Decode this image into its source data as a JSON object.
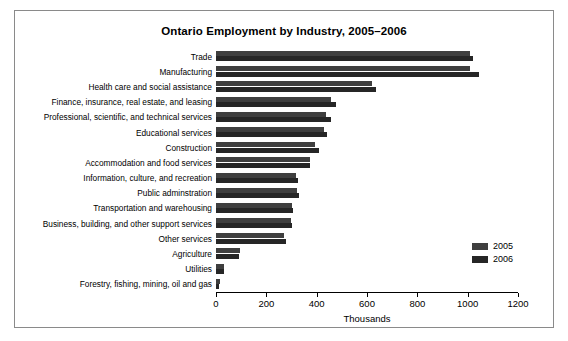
{
  "chart_data": {
    "type": "bar",
    "orientation": "horizontal",
    "title": "Ontario Employment by Industry, 2005–2006",
    "xlabel": "Thousands",
    "ylabel": "",
    "xlim": [
      0,
      1200
    ],
    "xticks": [
      0,
      200,
      400,
      600,
      800,
      1000,
      1200
    ],
    "xtick_labels": [
      "0",
      "200",
      "400",
      "600",
      "800",
      "1000",
      "1200"
    ],
    "grid": false,
    "legend_position": "right-lower",
    "categories": [
      "Trade",
      "Manufacturing",
      "Health care and social assistance",
      "Finance, insurance, real estate, and leasing",
      "Professional, scientific, and technical services",
      "Educational services",
      "Construction",
      "Accommodation and food services",
      "Information, culture, and recreation",
      "Public adminstration",
      "Transportation and warehousing",
      "Business, building, and other support services",
      "Other services",
      "Agriculture",
      "Utilities",
      "Forestry, fishing, mining, oil and gas"
    ],
    "series": [
      {
        "name": "2005",
        "color": "#3f3f3f",
        "values": [
          1008,
          1010,
          620,
          458,
          438,
          428,
          395,
          373,
          318,
          320,
          300,
          298,
          272,
          96,
          30,
          14
        ]
      },
      {
        "name": "2006",
        "color": "#262626",
        "values": [
          1022,
          1044,
          636,
          478,
          458,
          440,
          408,
          375,
          325,
          330,
          305,
          302,
          278,
          92,
          32,
          13
        ]
      }
    ]
  },
  "legend": {
    "entries": [
      {
        "label": "2005"
      },
      {
        "label": "2006"
      }
    ]
  }
}
